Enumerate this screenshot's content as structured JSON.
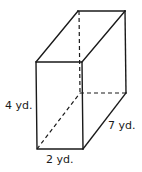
{
  "figure": {
    "type": "rectangular prism",
    "labels": {
      "height": "4 yd.",
      "width": "2 yd.",
      "depth": "7 yd."
    },
    "colors": {
      "stroke": "#1a1a1a",
      "background": "#ffffff"
    }
  }
}
